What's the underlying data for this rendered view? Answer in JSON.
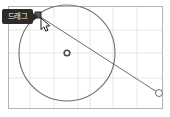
{
  "canvas": {
    "width": 170,
    "height": 117,
    "background_color": "#ffffff",
    "frame": {
      "x": 8,
      "y": 6,
      "width": 154,
      "height": 102,
      "stroke_color": "#b4b4b4"
    },
    "grid": {
      "enabled": true,
      "line_color": "#e6e6e6",
      "vertical_lines": [
        30,
        54,
        78,
        90,
        113,
        137
      ],
      "horizontal_lines": [
        30,
        53,
        78
      ]
    }
  },
  "tooltip": {
    "label": "드래그",
    "background_color": "#2b2b2b",
    "text_color": "#f2f2f2",
    "x": 3,
    "y": 10
  },
  "shape": {
    "type": "circle",
    "stroke_color": "#6e6e6e",
    "fill": "none",
    "center": {
      "x": 67,
      "y": 53
    },
    "radius": 48
  },
  "handles": [
    {
      "name": "drag-handle-active",
      "shape": "square",
      "x": 38,
      "y": 15,
      "size": 6,
      "fill_color": "#555555",
      "stroke_color": "#2b2b2b",
      "state": "active"
    },
    {
      "name": "center-marker",
      "shape": "ring",
      "x": 67,
      "y": 53,
      "radius": 4,
      "fill_color": "#ffffff",
      "stroke_color": "#4a4a4a",
      "state": "static"
    },
    {
      "name": "radius-endpoint-handle",
      "shape": "circle",
      "x": 159,
      "y": 93,
      "radius": 3.5,
      "fill_color": "#ffffff",
      "stroke_color": "#6e6e6e",
      "state": "idle"
    }
  ],
  "radius_line": {
    "name": "drag-guide-line",
    "from": {
      "x": 39,
      "y": 16
    },
    "to": {
      "x": 157,
      "y": 92
    },
    "stroke_color": "#6e6e6e"
  },
  "cursor": {
    "type": "arrow-pointer",
    "x": 41,
    "y": 18,
    "fill_color": "#ffffff",
    "stroke_color": "#1a1a1a"
  }
}
